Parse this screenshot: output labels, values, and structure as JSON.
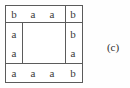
{
  "figure": {
    "caption_label": "(c)",
    "colors": {
      "background": "#fefefe",
      "box_fill": "#ffffff",
      "line": "#5b5b5b",
      "text": "#3a3a3a",
      "caption_text": "#2e2e2e"
    },
    "grid": {
      "rows": 4,
      "cols": 4,
      "hollow_center": true,
      "cells": {
        "top_row": [
          "b",
          "a",
          "a",
          "b"
        ],
        "left_col": [
          "a",
          "a"
        ],
        "right_col": [
          "b",
          "a"
        ],
        "bottom_row": [
          "a",
          "a",
          "a",
          "b"
        ]
      }
    }
  }
}
